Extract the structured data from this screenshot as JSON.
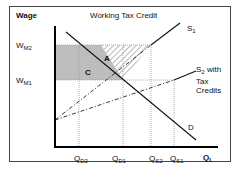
{
  "title": "Working Tax Credit",
  "y_axis_label": "Wage",
  "x_axis_label": {
    "main": "Q",
    "sub": "L"
  },
  "wage_levels": [
    {
      "main": "W",
      "sub": "M2"
    },
    {
      "main": "W",
      "sub": "M1"
    }
  ],
  "quantities": [
    {
      "main": "Q",
      "sub": "D2"
    },
    {
      "main": "Q",
      "sub": "D1"
    },
    {
      "main": "Q",
      "sub": "S2"
    },
    {
      "main": "Q",
      "sub": "S1"
    }
  ],
  "curves": {
    "s1": {
      "main": "S",
      "sub": "1"
    },
    "s2": {
      "main": "S",
      "sub": "2",
      "suffix_lines": [
        " with",
        "Tax",
        "Credits"
      ]
    },
    "d": "D"
  },
  "areas": {
    "a": "A",
    "c": "C"
  },
  "colors": {
    "shade": "#b8b8b8",
    "axis": "#000000",
    "guides": "#9a9a9a"
  }
}
